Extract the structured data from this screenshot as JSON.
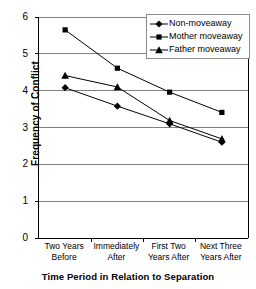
{
  "chart_data": {
    "type": "line",
    "title": "",
    "xlabel": "Time Period in Relation to Separation",
    "ylabel": "Frequency of Conflict",
    "categories": [
      "Two Years Before",
      "Immediately After",
      "First Two Years After",
      "Next Three Years After"
    ],
    "category_lines": [
      [
        "Two Years",
        "Before"
      ],
      [
        "Immediately",
        "After"
      ],
      [
        "First Two",
        "Years After"
      ],
      [
        "Next Three",
        "Years After"
      ]
    ],
    "series": [
      {
        "name": "Non-moveaway",
        "marker": "diamond",
        "values": [
          4.08,
          3.58,
          3.1,
          2.6
        ]
      },
      {
        "name": "Mother moveaway",
        "marker": "square",
        "values": [
          5.65,
          4.61,
          3.96,
          3.41
        ]
      },
      {
        "name": "Father moveaway",
        "marker": "triangle",
        "values": [
          4.41,
          4.1,
          3.19,
          2.69
        ]
      }
    ],
    "ylim": [
      0,
      6
    ],
    "yticks": [
      0,
      1,
      2,
      3,
      4,
      5,
      6
    ],
    "ytick_labels": [
      "0",
      "1",
      "2",
      "3",
      "4",
      "5",
      "6"
    ],
    "grid": "horizontal",
    "legend_position": "top-right",
    "line_color": "#000000",
    "grid_color": "#808080",
    "axis_color": "#000000"
  },
  "legend": {
    "entries": [
      {
        "label": "Non-moveaway",
        "marker": "diamond-marker-icon"
      },
      {
        "label": "Mother moveaway",
        "marker": "square-marker-icon"
      },
      {
        "label": "Father moveaway",
        "marker": "triangle-marker-icon"
      }
    ]
  },
  "axes": {
    "y_title": "Frequency of Conflict",
    "x_title": "Time Period in Relation to Separation"
  }
}
